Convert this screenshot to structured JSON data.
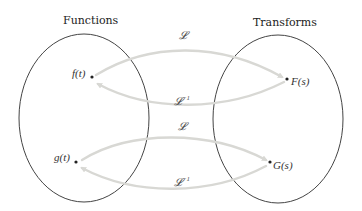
{
  "diagram": {
    "sets": [
      {
        "id": "functions",
        "title": "Functions"
      },
      {
        "id": "transforms",
        "title": "Transforms"
      }
    ],
    "elements": {
      "f": "f(t)",
      "F": "F(s)",
      "g": "g(t)",
      "G": "G(s)"
    },
    "operators": {
      "forward": "𝓛",
      "inverse": "𝓛",
      "inverse_superscript": "−1"
    },
    "mappings": [
      {
        "from": "f(t)",
        "to": "F(s)",
        "operator": "𝓛"
      },
      {
        "from": "F(s)",
        "to": "f(t)",
        "operator": "𝓛⁻¹"
      },
      {
        "from": "g(t)",
        "to": "G(s)",
        "operator": "𝓛"
      },
      {
        "from": "G(s)",
        "to": "g(t)",
        "operator": "𝓛⁻¹"
      }
    ],
    "colors": {
      "outline": "#444444",
      "arrow": "#d8d8d4",
      "text": "#222222"
    }
  }
}
